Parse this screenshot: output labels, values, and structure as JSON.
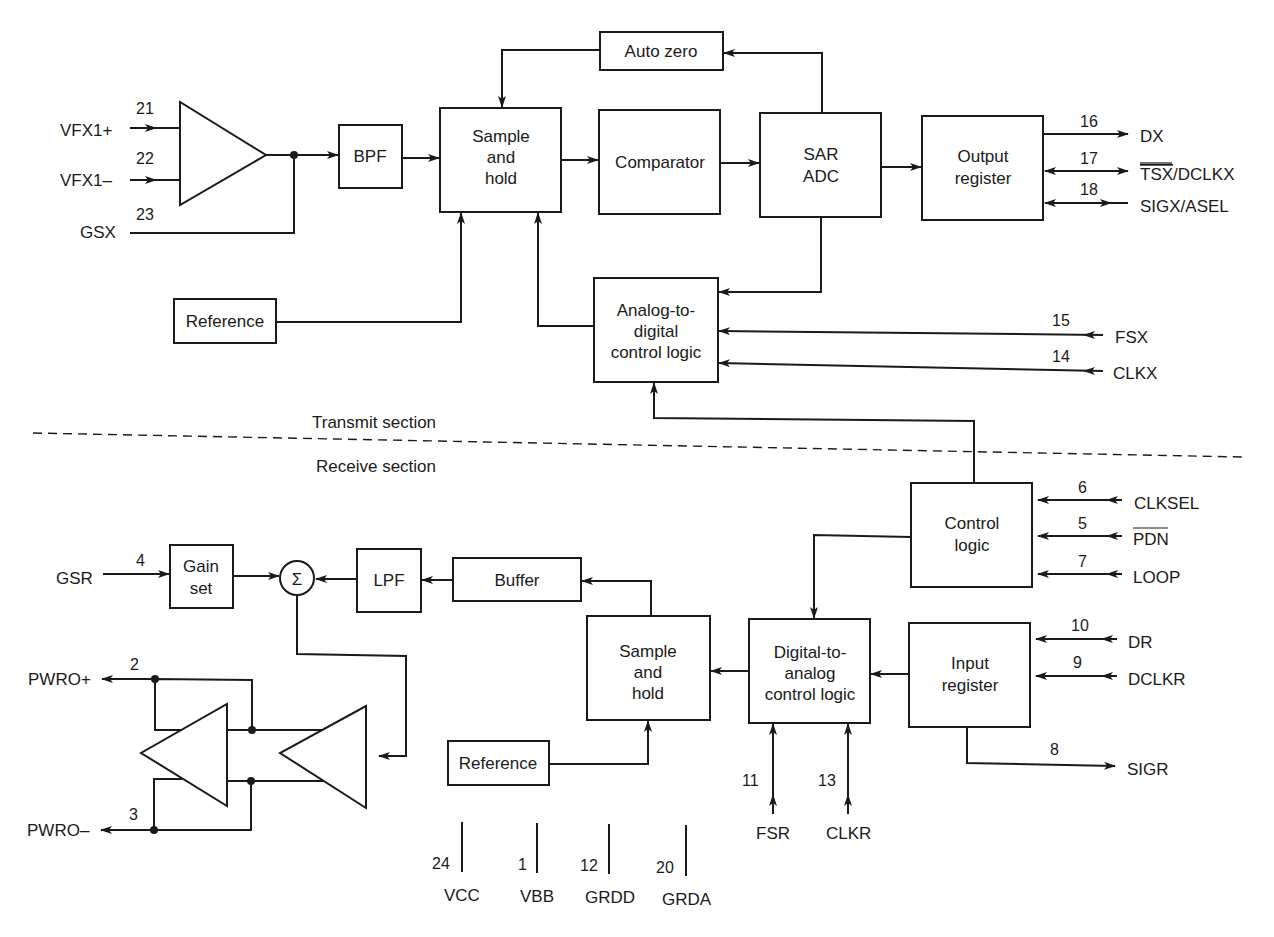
{
  "diagram": {
    "type": "block-diagram",
    "sections": {
      "transmit": "Transmit section",
      "receive": "Receive section"
    },
    "transmit_blocks": {
      "auto_zero": "Auto zero",
      "bpf": "BPF",
      "sample_hold": [
        "Sample",
        "and",
        "hold"
      ],
      "comparator": "Comparator",
      "sar_adc": [
        "SAR",
        "ADC"
      ],
      "output_register": [
        "Output",
        "register"
      ],
      "reference": "Reference",
      "ad_control": [
        "Analog-to-",
        "digital",
        "control logic"
      ]
    },
    "receive_blocks": {
      "control_logic": [
        "Control",
        "logic"
      ],
      "gain_set": [
        "Gain",
        "set"
      ],
      "summer": "Σ",
      "lpf": "LPF",
      "buffer": "Buffer",
      "sample_hold": [
        "Sample",
        "and",
        "hold"
      ],
      "da_control": [
        "Digital-to-",
        "analog",
        "control logic"
      ],
      "input_register": [
        "Input",
        "register"
      ],
      "reference": "Reference"
    },
    "transmit_pins": [
      {
        "pin": "21",
        "name": "VFX1+"
      },
      {
        "pin": "22",
        "name": "VFX1–"
      },
      {
        "pin": "23",
        "name": "GSX"
      },
      {
        "pin": "16",
        "name": "DX"
      },
      {
        "pin": "17",
        "name": "TSX/DCLKX",
        "overline": "TSX",
        "rest": "/DCLKX"
      },
      {
        "pin": "18",
        "name": "SIGX/ASEL"
      },
      {
        "pin": "15",
        "name": "FSX"
      },
      {
        "pin": "14",
        "name": "CLKX"
      }
    ],
    "receive_pins": [
      {
        "pin": "6",
        "name": "CLKSEL"
      },
      {
        "pin": "5",
        "name": "PDN",
        "overline": "PDN"
      },
      {
        "pin": "7",
        "name": "LOOP"
      },
      {
        "pin": "4",
        "name": "GSR"
      },
      {
        "pin": "2",
        "name": "PWRO+"
      },
      {
        "pin": "3",
        "name": "PWRO–"
      },
      {
        "pin": "10",
        "name": "DR"
      },
      {
        "pin": "9",
        "name": "DCLKR"
      },
      {
        "pin": "8",
        "name": "SIGR"
      },
      {
        "pin": "11",
        "name": "FSR"
      },
      {
        "pin": "13",
        "name": "CLKR"
      }
    ],
    "power_pins": [
      {
        "pin": "24",
        "name": "VCC"
      },
      {
        "pin": "1",
        "name": "VBB"
      },
      {
        "pin": "12",
        "name": "GRDD"
      },
      {
        "pin": "20",
        "name": "GRDA"
      }
    ]
  }
}
